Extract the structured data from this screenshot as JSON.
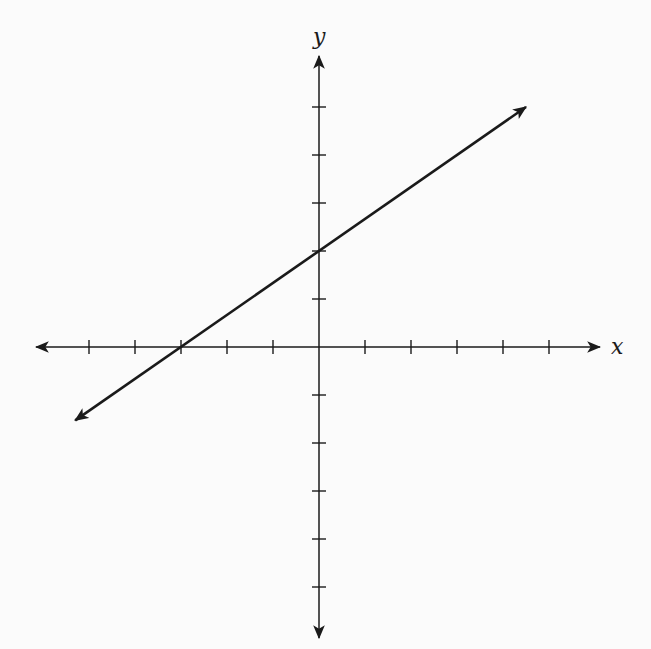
{
  "chart_data": {
    "type": "line",
    "title": "",
    "xlabel": "x",
    "ylabel": "y",
    "xlim": [
      -6,
      6
    ],
    "ylim": [
      -6,
      6
    ],
    "grid": false,
    "x_ticks": [
      -5,
      -4,
      -3,
      -2,
      -1,
      1,
      2,
      3,
      4,
      5
    ],
    "y_ticks": [
      -5,
      -4,
      -3,
      -2,
      -1,
      1,
      2,
      3,
      4,
      5
    ],
    "tick_labels_shown": false,
    "series": [
      {
        "name": "line",
        "equation": "y = (2/3)x + 2",
        "slope": 0.6667,
        "y_intercept": 2,
        "x_intercept": -3,
        "x": [
          -5.3,
          4.5
        ],
        "y": [
          -1.53,
          5.0
        ],
        "arrows_both_ends": true
      }
    ]
  },
  "labels": {
    "x_axis": "x",
    "y_axis": "y"
  },
  "colors": {
    "background": "#fbfbfb",
    "ink": "#1a1a1a"
  }
}
